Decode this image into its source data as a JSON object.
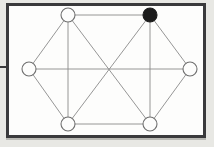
{
  "figure": {
    "canvas": {
      "width": 214,
      "height": 147
    },
    "colors": {
      "page_background": "#cfcfc9",
      "figure_background": "#e8e8e4",
      "plot_background": "#fdfdfc",
      "frame_border": "#3a3a3c",
      "edge_stroke": "#8a8a8a",
      "node_outline": "#6f6f6f",
      "node_open_fill": "#fdfdfc",
      "node_filled_fill": "#1c1c1c"
    },
    "frame": {
      "x": 6,
      "y": 3,
      "width": 200,
      "height": 135,
      "border_width": 3
    },
    "node_radius": 7,
    "edge_stroke_width": 0.9,
    "nodes": [
      {
        "id": "top-left",
        "label": "",
        "x": 68,
        "y": 15,
        "state": "open",
        "fill": "#fdfdfc"
      },
      {
        "id": "top-right",
        "label": "",
        "x": 150,
        "y": 15,
        "state": "filled",
        "fill": "#1c1c1c"
      },
      {
        "id": "middle-left",
        "label": "",
        "x": 29,
        "y": 69,
        "state": "open",
        "fill": "#fdfdfc"
      },
      {
        "id": "middle-right",
        "label": "",
        "x": 190,
        "y": 69,
        "state": "open",
        "fill": "#fdfdfc"
      },
      {
        "id": "bottom-left",
        "label": "",
        "x": 68,
        "y": 124,
        "state": "open",
        "fill": "#fdfdfc"
      },
      {
        "id": "bottom-right",
        "label": "",
        "x": 150,
        "y": 124,
        "state": "open",
        "fill": "#fdfdfc"
      }
    ],
    "edges": [
      {
        "id": "edge-top",
        "from": "top-left",
        "to": "top-right"
      },
      {
        "id": "edge-bottom",
        "from": "bottom-left",
        "to": "bottom-right"
      },
      {
        "id": "edge-left-upper",
        "from": "middle-left",
        "to": "top-left"
      },
      {
        "id": "edge-left-lower",
        "from": "middle-left",
        "to": "bottom-left"
      },
      {
        "id": "edge-right-upper",
        "from": "middle-right",
        "to": "top-right"
      },
      {
        "id": "edge-right-lower",
        "from": "middle-right",
        "to": "bottom-right"
      },
      {
        "id": "edge-left-vertical",
        "from": "top-left",
        "to": "bottom-left"
      },
      {
        "id": "edge-right-vertical",
        "from": "top-right",
        "to": "bottom-right"
      },
      {
        "id": "edge-spine",
        "from": "middle-left",
        "to": "middle-right"
      },
      {
        "id": "edge-diag-tl-br",
        "from": "top-left",
        "to": "bottom-right"
      },
      {
        "id": "edge-diag-tr-bl",
        "from": "top-right",
        "to": "bottom-left"
      }
    ],
    "markers": {
      "left_tick": {
        "x": 0,
        "y": 66,
        "width": 6,
        "height": 2
      }
    }
  }
}
